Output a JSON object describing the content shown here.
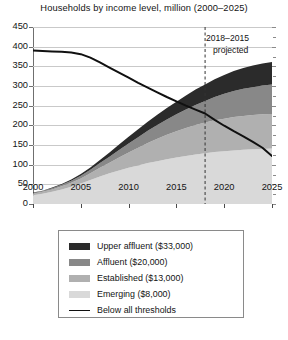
{
  "chart_data": {
    "type": "area",
    "title": "Households by income level, million (2000–2025)",
    "xlabel": "",
    "ylabel": "",
    "xlim": [
      2000,
      2025
    ],
    "ylim": [
      0,
      450
    ],
    "yticks": [
      0,
      50,
      100,
      150,
      200,
      250,
      300,
      350,
      400,
      450
    ],
    "xticks": [
      2000,
      2005,
      2010,
      2015,
      2020,
      2025
    ],
    "grid": true,
    "stacked": true,
    "legend_position": "below-plot",
    "x": [
      2000,
      2001,
      2002,
      2003,
      2004,
      2005,
      2006,
      2007,
      2008,
      2009,
      2010,
      2011,
      2012,
      2013,
      2014,
      2015,
      2016,
      2017,
      2018,
      2019,
      2020,
      2021,
      2022,
      2023,
      2024,
      2025
    ],
    "series": [
      {
        "name": "Emerging ($8,000)",
        "color": "#d9d9d9",
        "values": [
          22,
          26,
          31,
          37,
          44,
          52,
          61,
          70,
          78,
          85,
          92,
          98,
          104,
          109,
          114,
          118,
          122,
          126,
          129,
          132,
          134,
          136,
          138,
          139,
          140,
          141
        ]
      },
      {
        "name": "Established ($13,000)",
        "color": "#b0b0b0",
        "values": [
          4,
          5,
          6,
          8,
          10,
          13,
          17,
          22,
          27,
          33,
          39,
          45,
          51,
          57,
          62,
          67,
          71,
          75,
          78,
          81,
          83,
          85,
          86,
          87,
          88,
          88
        ]
      },
      {
        "name": "Affluent ($20,000)",
        "color": "#888888",
        "values": [
          2,
          2,
          3,
          4,
          5,
          7,
          9,
          12,
          15,
          19,
          23,
          27,
          31,
          35,
          39,
          43,
          47,
          51,
          55,
          59,
          63,
          66,
          69,
          71,
          73,
          75
        ]
      },
      {
        "name": "Upper affluent ($33,000)",
        "color": "#2b2b2b",
        "values": [
          1,
          1,
          2,
          2,
          3,
          4,
          6,
          8,
          11,
          14,
          17,
          20,
          23,
          26,
          29,
          32,
          36,
          39,
          42,
          45,
          48,
          51,
          53,
          55,
          56,
          57
        ]
      }
    ],
    "line_series": {
      "name": "Below all thresholds",
      "color": "#101010",
      "values": [
        390,
        389,
        388,
        387,
        385,
        381,
        372,
        360,
        347,
        334,
        321,
        308,
        296,
        284,
        272,
        261,
        250,
        240,
        230,
        214,
        199,
        185,
        172,
        158,
        143,
        122
      ]
    },
    "annotations": [
      {
        "name": "projection-divider",
        "x": 2018,
        "style": "dashed-vertical",
        "label_line1": "2018–2015",
        "label_line2": "projected"
      }
    ]
  },
  "legend": {
    "items": [
      {
        "label": "Upper affluent ($33,000)",
        "color": "#2b2b2b",
        "type": "swatch"
      },
      {
        "label": "Affluent ($20,000)",
        "color": "#888888",
        "type": "swatch"
      },
      {
        "label": "Established ($13,000)",
        "color": "#b0b0b0",
        "type": "swatch"
      },
      {
        "label": "Emerging ($8,000)",
        "color": "#d9d9d9",
        "type": "swatch"
      },
      {
        "label": "Below all thresholds",
        "color": "#101010",
        "type": "line"
      }
    ]
  }
}
